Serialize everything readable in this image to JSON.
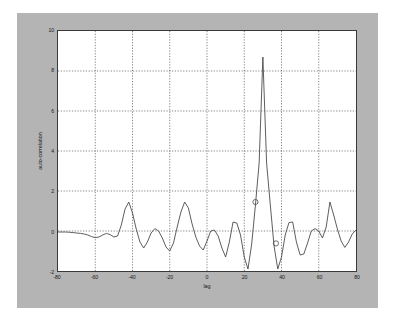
{
  "figure": {
    "background_color": "#b4b4b4",
    "axes_background_color": "#ffffff",
    "axes_border_color": "#3a3a3a",
    "line_color": "#4a4a4a",
    "grid_color": "#4a4a4a"
  },
  "chart_data": {
    "type": "line",
    "title": "",
    "xlabel": "lag",
    "ylabel": "auto-correlation",
    "xlim": [
      -80,
      80
    ],
    "ylim": [
      -2,
      10
    ],
    "xticks": [
      -80,
      -60,
      -40,
      -20,
      0,
      20,
      40,
      60,
      80
    ],
    "xtick_labels": [
      "-80",
      "-60",
      "-40",
      "-20",
      "0",
      "20",
      "40",
      "60",
      "80"
    ],
    "yticks": [
      -2,
      0,
      2,
      4,
      6,
      8,
      10
    ],
    "ytick_labels": [
      "-2",
      "0",
      "2",
      "4",
      "6",
      "8",
      "10"
    ],
    "grid": true,
    "grid_style": "dotted",
    "legend": null,
    "series": [
      {
        "name": "auto-correlation",
        "marker": "none",
        "x": [
          -80,
          -78,
          -76,
          -74,
          -72,
          -70,
          -68,
          -66,
          -64,
          -62,
          -60,
          -58,
          -56,
          -54,
          -52,
          -50,
          -48,
          -46,
          -44,
          -42,
          -40,
          -38,
          -36,
          -34,
          -32,
          -30,
          -28,
          -26,
          -24,
          -22,
          -20,
          -18,
          -16,
          -14,
          -12,
          -10,
          -8,
          -6,
          -4,
          -2,
          0,
          2,
          4,
          6,
          8,
          10,
          12,
          14,
          16,
          18,
          20,
          22,
          24,
          26,
          28,
          30,
          32,
          34,
          36,
          38,
          40,
          42,
          44,
          46,
          48,
          50,
          52,
          54,
          56,
          58,
          60,
          62,
          64,
          66,
          68,
          70,
          72,
          74,
          76,
          78,
          80
        ],
        "y": [
          -0.05,
          -0.05,
          -0.05,
          -0.06,
          -0.08,
          -0.1,
          -0.12,
          -0.15,
          -0.2,
          -0.28,
          -0.33,
          -0.3,
          -0.2,
          -0.12,
          -0.18,
          -0.3,
          -0.25,
          0.3,
          1.1,
          1.45,
          0.9,
          0.1,
          -0.55,
          -0.85,
          -0.55,
          -0.1,
          0.12,
          0.0,
          -0.35,
          -0.8,
          -1.0,
          -0.6,
          0.2,
          0.95,
          1.45,
          1.15,
          0.35,
          -0.3,
          -0.75,
          -0.95,
          -0.5,
          0.0,
          0.05,
          -0.25,
          -0.85,
          -1.3,
          -0.55,
          0.45,
          0.4,
          -0.2,
          -1.3,
          -1.9,
          -0.65,
          1.3,
          3.4,
          8.7,
          3.4,
          1.3,
          -0.75,
          -1.9,
          -1.3,
          -0.2,
          0.42,
          0.45,
          -0.55,
          -1.2,
          -1.15,
          -0.6,
          0.0,
          0.12,
          0.0,
          -0.35,
          0.2,
          1.45,
          0.8,
          0.1,
          -0.5,
          -0.82,
          -0.55,
          -0.15,
          0.05
        ]
      }
    ],
    "markers": [
      {
        "x": 26,
        "y": 1.45,
        "shape": "circle",
        "label": "data-point-marker-peak"
      },
      {
        "x": 37,
        "y": -0.62,
        "shape": "circle",
        "label": "data-point-marker-trough"
      }
    ]
  }
}
